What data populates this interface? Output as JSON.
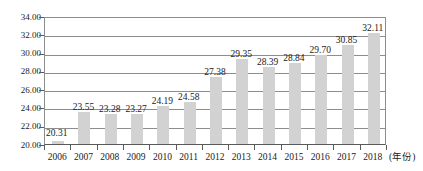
{
  "chart_data": {
    "type": "bar",
    "title": "",
    "xlabel": "(年份)",
    "ylabel": "",
    "categories": [
      "2006",
      "2007",
      "2008",
      "2009",
      "2010",
      "2011",
      "2012",
      "2013",
      "2014",
      "2015",
      "2016",
      "2017",
      "2018"
    ],
    "values": [
      20.31,
      23.55,
      23.28,
      23.27,
      24.19,
      24.58,
      27.38,
      29.35,
      28.39,
      28.84,
      29.7,
      30.85,
      32.11
    ],
    "value_labels": [
      "20.31",
      "23.55",
      "23.28",
      "23.27",
      "24.19",
      "24.58",
      "27.38",
      "29.35",
      "28.39",
      "28.84",
      "29.70",
      "30.85",
      "32.11"
    ],
    "ylim": [
      20.0,
      34.0
    ],
    "ytick_step": 2.0,
    "ytick_labels": [
      "34.00",
      "32.00",
      "30.00",
      "28.00",
      "26.00",
      "24.00",
      "22.00",
      "20.00"
    ],
    "ytick_values": [
      34.0,
      32.0,
      30.0,
      28.0,
      26.0,
      24.0,
      22.0,
      20.0
    ],
    "grid": true,
    "legend": null,
    "series_color": "#d2d2d2",
    "axis_color": "#5a5a5a",
    "gridline_color": "#8d8d8d"
  },
  "axis": {
    "x_unit_label": "(年份)"
  }
}
